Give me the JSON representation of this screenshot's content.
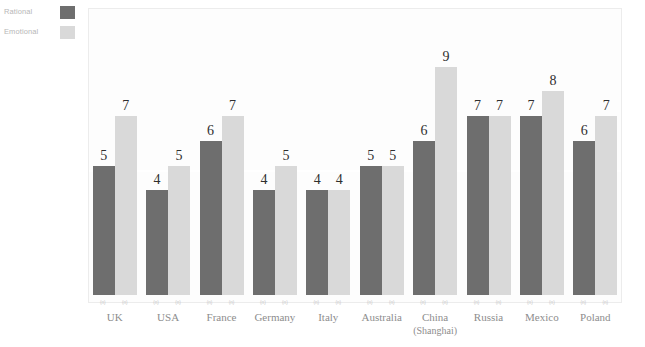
{
  "legend": {
    "items": [
      {
        "label": "Rational",
        "color": "#6e6e6e",
        "swatch_name": "legend-swatch-rational"
      },
      {
        "label": "Emotional",
        "color": "#d9d9d9",
        "swatch_name": "legend-swatch-emotional"
      }
    ]
  },
  "chart_data": {
    "type": "bar",
    "title": "",
    "subtitle": "",
    "xlabel": "",
    "ylabel": "",
    "ylim": [
      0,
      10
    ],
    "grid": true,
    "gridlines": [
      4.7
    ],
    "legend_position": "top-left",
    "categories": [
      "UK",
      "USA",
      "France",
      "Germany",
      "Italy",
      "Australia",
      "China",
      "Russia",
      "Mexico",
      "Poland"
    ],
    "category_sublabels": [
      "",
      "",
      "",
      "",
      "",
      "",
      "(Shanghai)",
      "",
      "",
      ""
    ],
    "series": [
      {
        "name": "Rational",
        "color": "#6e6e6e",
        "values": [
          5,
          4,
          6,
          4,
          4,
          5,
          6,
          7,
          7,
          6
        ],
        "notes": [
          "(n)",
          "(n)",
          "(n)",
          "(n)",
          "(n)",
          "(n)",
          "(n)",
          "(n)",
          "(n)",
          "(n)"
        ]
      },
      {
        "name": "Emotional",
        "color": "#d9d9d9",
        "values": [
          7,
          5,
          7,
          5,
          4,
          5,
          9,
          7,
          8,
          7
        ],
        "notes": [
          "(n)",
          "(n)",
          "(n)",
          "(n)",
          "(n)",
          "(n)",
          "(n)",
          "(n)",
          "(n)",
          "(n)"
        ]
      }
    ]
  }
}
